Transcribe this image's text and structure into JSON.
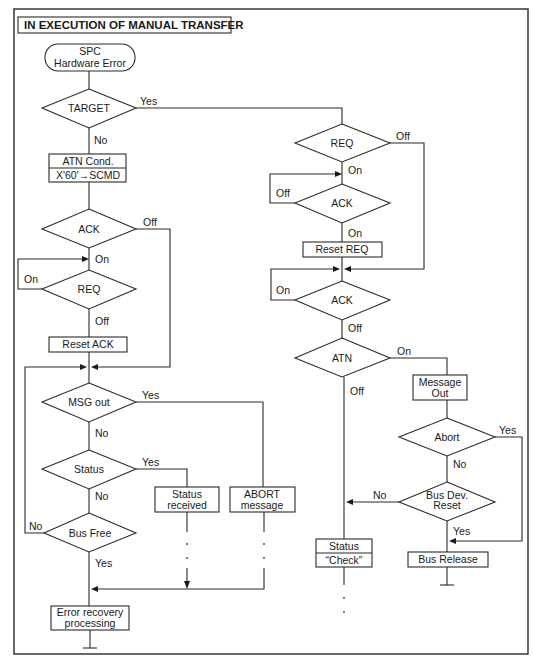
{
  "title": "IN EXECUTION OF MANUAL TRANSFER",
  "nodes": {
    "start": {
      "type": "terminal",
      "lines": [
        "SPC",
        "Hardware Error"
      ]
    },
    "target": {
      "type": "decision",
      "label": "TARGET"
    },
    "atn_cond": {
      "type": "process",
      "lines": [
        "ATN Cond.",
        "X'60'→SCMD"
      ]
    },
    "ack_left": {
      "type": "decision",
      "label": "ACK"
    },
    "req_left": {
      "type": "decision",
      "label": "REQ"
    },
    "reset_ack": {
      "type": "process",
      "label": "Reset ACK"
    },
    "msg_out": {
      "type": "decision",
      "label": "MSG out"
    },
    "status": {
      "type": "decision",
      "label": "Status"
    },
    "status_received": {
      "type": "process",
      "lines": [
        "Status",
        "received"
      ]
    },
    "abort_message": {
      "type": "process",
      "lines": [
        "ABORT",
        "message"
      ]
    },
    "bus_free": {
      "type": "decision",
      "label": "Bus Free"
    },
    "error_recovery": {
      "type": "process",
      "lines": [
        "Error recovery",
        "processing"
      ]
    },
    "req_right": {
      "type": "decision",
      "label": "REQ"
    },
    "ack_right_1": {
      "type": "decision",
      "label": "ACK"
    },
    "reset_req": {
      "type": "process",
      "label": "Reset REQ"
    },
    "ack_right_2": {
      "type": "decision",
      "label": "ACK"
    },
    "atn": {
      "type": "decision",
      "label": "ATN"
    },
    "message_out": {
      "type": "process",
      "lines": [
        "Message",
        "Out"
      ]
    },
    "abort": {
      "type": "decision",
      "label": "Abort"
    },
    "bus_dev_reset": {
      "type": "decision",
      "lines": [
        "Bus Dev.",
        "Reset"
      ]
    },
    "status_check": {
      "type": "process",
      "lines": [
        "Status",
        "“Check”"
      ]
    },
    "bus_release": {
      "type": "process",
      "label": "Bus Release"
    }
  },
  "edges": {
    "target_yes": "Yes",
    "target_no": "No",
    "ack_left_off": "Off",
    "ack_left_on": "On",
    "req_left_on": "On",
    "req_left_off": "Off",
    "msg_out_yes": "Yes",
    "msg_out_no": "No",
    "status_yes": "Yes",
    "status_no": "No",
    "bus_free_no": "No",
    "bus_free_yes": "Yes",
    "req_right_off": "Off",
    "req_right_on": "On",
    "ack_right_1_off": "Off",
    "ack_right_1_on": "On",
    "ack_right_2_on": "On",
    "ack_right_2_off": "Off",
    "atn_on": "On",
    "atn_off": "Off",
    "abort_yes": "Yes",
    "abort_no": "No",
    "bus_dev_reset_no": "No",
    "bus_dev_reset_yes": "Yes"
  },
  "colors": {
    "line": "#2a2a2a",
    "background": "#ffffff",
    "text": "#1a1a1a"
  }
}
